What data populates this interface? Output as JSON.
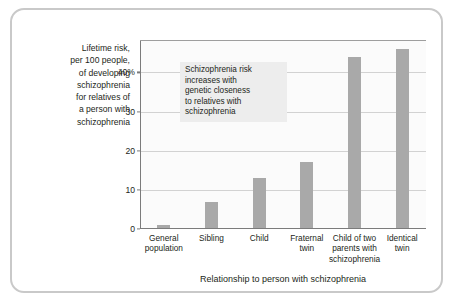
{
  "chart_data": {
    "type": "bar",
    "title": "",
    "ylabel": "Lifetime risk, per 100 people, of developing schizophrenia for relatives of a person with schizophrenia",
    "xlabel": "Relationship to person with schizophrenia",
    "categories": [
      "General population",
      "Sibling",
      "Child",
      "Fraternal twin",
      "Child of two parents with schizophrenia",
      "Identical twin"
    ],
    "values": [
      1,
      7,
      13,
      17,
      44,
      46
    ],
    "ylim": [
      0,
      48
    ],
    "yticks": [
      0,
      10,
      20,
      30,
      40
    ],
    "ytick_labels": [
      "0",
      "10",
      "20",
      "30",
      "40%"
    ],
    "grid": "horizontal",
    "legend": "none",
    "bar_color": "#a9a9a9",
    "annotations": [
      "Schizophrenia risk increases with genetic closeness to relatives with schizophrenia"
    ]
  },
  "figure": {
    "y_axis_caption_lines": [
      "Lifetime risk,",
      "per 100 people,",
      "of developing",
      "schizophrenia",
      "for relatives of",
      "a person with",
      "schizophrenia"
    ],
    "x_axis_title": "Relationship to person with schizophrenia",
    "annotation_lines": [
      "Schizophrenia risk",
      "increases with",
      "genetic closeness",
      "to relatives with",
      "schizophrenia"
    ],
    "x_tick_labels": [
      [
        "General",
        "population"
      ],
      [
        "Sibling"
      ],
      [
        "Child"
      ],
      [
        "Fraternal",
        "twin"
      ],
      [
        "Child of two",
        "parents with",
        "schizophrenia"
      ],
      [
        "Identical",
        "twin"
      ]
    ]
  },
  "colors": {
    "bar": "#a9a9a9",
    "grid": "#d2d2d2",
    "axis": "#7b7b7b",
    "frame": "#c9c9c9",
    "annotation_bg": "#ededed",
    "text": "#231f20",
    "plot_bg": "#fbfbfb"
  }
}
